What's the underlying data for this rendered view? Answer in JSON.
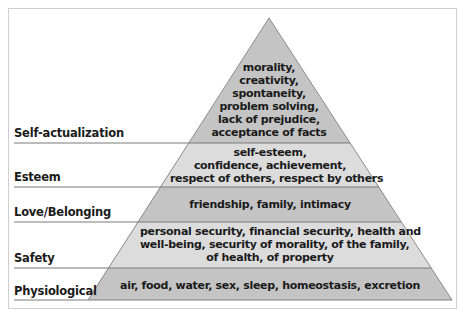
{
  "diagram": {
    "type": "pyramid",
    "colors": {
      "dark_band": "#c4c4c4",
      "light_band": "#dcdcdc",
      "outline": "#8a8a8a",
      "divider": "#7a7a7a",
      "text": "#1a1a1a"
    },
    "levels": [
      {
        "name": "Self-actualization",
        "lines": [
          "morality,",
          "creativity,",
          "spontaneity,",
          "problem solving,",
          "lack of prejudice,",
          "acceptance of facts"
        ]
      },
      {
        "name": "Esteem",
        "lines": [
          "self-esteem,",
          "confidence, achievement,",
          "respect of others, respect by others"
        ]
      },
      {
        "name": "Love/Belonging",
        "lines": [
          "friendship, family, intimacy"
        ]
      },
      {
        "name": "Safety",
        "lines": [
          "personal security, financial security, health and",
          "well-being, security of morality, of the family,",
          "of health, of property"
        ]
      },
      {
        "name": "Physiological",
        "lines": [
          "air, food, water, sex, sleep, homeostasis, excretion"
        ]
      }
    ]
  }
}
